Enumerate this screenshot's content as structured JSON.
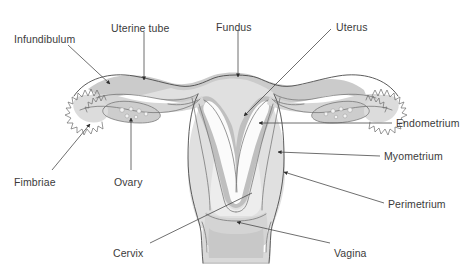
{
  "figure": {
    "background_color": "#ffffff",
    "line_color": "#4a4a4a",
    "text_color": "#3b3b3b",
    "tissue_colors": {
      "perimetrium": "#c9c9c9",
      "myometrium": "#dedede",
      "endometrium": "#bdbdbd",
      "cavity": "#ffffff",
      "vagina_lumen": "#c6c6c6",
      "ovary": "#cfcfcf",
      "tube_wall": "#e8e8e8"
    }
  },
  "labels": [
    {
      "id": "infundibulum",
      "text": "Infundibulum",
      "x": 14,
      "y": 33,
      "anchor": "start"
    },
    {
      "id": "uterine-tube",
      "text": "Uterine tube",
      "x": 111,
      "y": 22,
      "anchor": "start"
    },
    {
      "id": "fundus",
      "text": "Fundus",
      "x": 216,
      "y": 21,
      "anchor": "start"
    },
    {
      "id": "uterus",
      "text": "Uterus",
      "x": 336,
      "y": 21,
      "anchor": "start"
    },
    {
      "id": "endometrium",
      "text": "Endometrium",
      "x": 396,
      "y": 118,
      "anchor": "start"
    },
    {
      "id": "myometrium",
      "text": "Myometrium",
      "x": 384,
      "y": 152,
      "anchor": "start"
    },
    {
      "id": "perimetrium",
      "text": "Perimetrium",
      "x": 388,
      "y": 200,
      "anchor": "start"
    },
    {
      "id": "fimbriae",
      "text": "Fimbriae",
      "x": 14,
      "y": 177,
      "anchor": "start"
    },
    {
      "id": "ovary",
      "text": "Ovary",
      "x": 114,
      "y": 177,
      "anchor": "start"
    },
    {
      "id": "cervix",
      "text": "Cervix",
      "x": 113,
      "y": 249,
      "anchor": "start"
    },
    {
      "id": "vagina",
      "text": "Vagina",
      "x": 334,
      "y": 249,
      "anchor": "start"
    }
  ],
  "leader_lines": [
    {
      "id": "infundibulum-leader",
      "arrow": true,
      "points": "68,45 112,85"
    },
    {
      "id": "uterine-tube-leader",
      "arrow": true,
      "points": "144,32 144,82"
    },
    {
      "id": "fundus-leader",
      "arrow": true,
      "points": "238,30 238,78"
    },
    {
      "id": "uterus-leader",
      "arrow": true,
      "points": "330,30 243,117"
    },
    {
      "id": "endometrium-leader",
      "arrow": true,
      "points": "392,123 258,123"
    },
    {
      "id": "myometrium-leader",
      "arrow": true,
      "points": "380,156 277,152"
    },
    {
      "id": "perimetrium-leader",
      "arrow": true,
      "points": "384,203 283,172"
    },
    {
      "id": "fimbriae-leader",
      "arrow": false,
      "points": "54,170 92,126"
    },
    {
      "id": "ovary-leader",
      "arrow": true,
      "points": "131,170 131,120"
    },
    {
      "id": "cervix-leader",
      "arrow": false,
      "points": "152,243 250,194"
    },
    {
      "id": "vagina-leader",
      "arrow": true,
      "points": "330,243 236,223"
    }
  ]
}
